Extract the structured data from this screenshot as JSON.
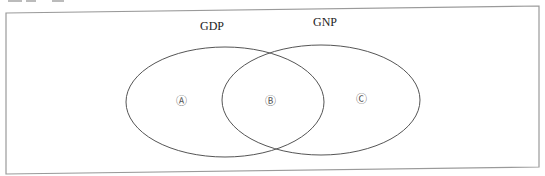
{
  "diagram": {
    "type": "venn",
    "sets": [
      {
        "id": "gdp",
        "title": "GDP",
        "title_pos": [
          212,
          30
        ],
        "ellipse": {
          "cx": 225,
          "cy": 102,
          "rx": 99,
          "ry": 55
        }
      },
      {
        "id": "gnp",
        "title": "GNP",
        "title_pos": [
          325,
          26
        ],
        "ellipse": {
          "cx": 321,
          "cy": 100,
          "rx": 99,
          "ry": 55
        }
      }
    ],
    "regions": [
      {
        "id": "A",
        "label": "Ⓐ",
        "pos": [
          181,
          105
        ]
      },
      {
        "id": "B",
        "label": "Ⓑ",
        "pos": [
          270,
          105
        ]
      },
      {
        "id": "C",
        "label": "Ⓒ",
        "pos": [
          361,
          103
        ]
      }
    ],
    "frame": {
      "points": [
        [
          6,
          13
        ],
        [
          539,
          6
        ],
        [
          539,
          167
        ],
        [
          6,
          174
        ]
      ]
    },
    "colors": {
      "frame": "#9a9a9a",
      "ellipse": "#555555",
      "text": "#222222"
    }
  }
}
